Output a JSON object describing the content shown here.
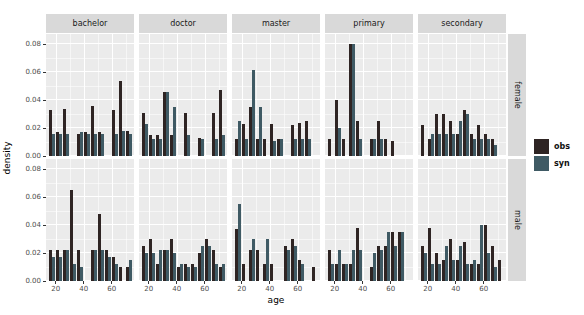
{
  "chart_data": {
    "type": "bar",
    "title": "",
    "xlabel": "age",
    "ylabel": "density",
    "x_ticks": [
      20,
      40,
      60
    ],
    "x_minor_ticks": [
      30,
      50,
      70
    ],
    "y_ticks": [
      0.0,
      0.02,
      0.04,
      0.06,
      0.08
    ],
    "xlim": [
      13,
      76
    ],
    "ylim": [
      0,
      0.0875
    ],
    "grid": true,
    "legend_position": "right",
    "col_facets": [
      "bachelor",
      "doctor",
      "master",
      "primary",
      "secondary"
    ],
    "row_facets": [
      "female",
      "male"
    ],
    "age_bin_left_edges": [
      15,
      20,
      25,
      30,
      35,
      40,
      45,
      50,
      55,
      60,
      65,
      70
    ],
    "age_bin_width": 5,
    "series_names": [
      "obs",
      "syn"
    ],
    "panels": [
      {
        "row": "female",
        "col": "bachelor",
        "obs": [
          0.033,
          0.017,
          0.034,
          0,
          0.016,
          0.017,
          0.036,
          0.017,
          0,
          0.033,
          0.054,
          0.018
        ],
        "syn": [
          0.016,
          0.016,
          0.016,
          0,
          0.017,
          0.016,
          0.016,
          0.016,
          0,
          0.016,
          0.018,
          0.016
        ]
      },
      {
        "row": "female",
        "col": "doctor",
        "obs": [
          0.031,
          0.015,
          0.015,
          0.046,
          0.015,
          0,
          0.031,
          0,
          0.013,
          0,
          0.031,
          0.047
        ],
        "syn": [
          0.023,
          0.012,
          0.012,
          0.046,
          0.035,
          0,
          0.015,
          0,
          0.012,
          0,
          0.012,
          0.015
        ]
      },
      {
        "row": "female",
        "col": "master",
        "obs": [
          0.012,
          0.023,
          0.035,
          0.012,
          0.012,
          0.023,
          0.012,
          0,
          0.022,
          0.024,
          0.025,
          0
        ],
        "syn": [
          0.025,
          0.012,
          0.062,
          0.035,
          0,
          0.011,
          0.012,
          0,
          0.012,
          0.012,
          0.012,
          0
        ]
      },
      {
        "row": "female",
        "col": "primary",
        "obs": [
          0.012,
          0.04,
          0.012,
          0.08,
          0.025,
          0,
          0.012,
          0.025,
          0.012,
          0.011,
          0,
          0
        ],
        "syn": [
          0,
          0.02,
          0,
          0.08,
          0.012,
          0,
          0.012,
          0.012,
          0,
          0,
          0,
          0
        ]
      },
      {
        "row": "female",
        "col": "secondary",
        "obs": [
          0.022,
          0.012,
          0.03,
          0.03,
          0.025,
          0.016,
          0.033,
          0.016,
          0.022,
          0.016,
          0.012,
          0
        ],
        "syn": [
          0,
          0.016,
          0.016,
          0.016,
          0.016,
          0.025,
          0.03,
          0.012,
          0.012,
          0.012,
          0.008,
          0
        ]
      },
      {
        "row": "male",
        "col": "bachelor",
        "obs": [
          0.022,
          0.022,
          0.022,
          0.065,
          0.022,
          0,
          0.022,
          0.048,
          0.022,
          0.017,
          0.01,
          0.01
        ],
        "syn": [
          0.017,
          0.017,
          0.022,
          0.012,
          0.01,
          0,
          0.022,
          0.022,
          0.017,
          0.012,
          0,
          0.015
        ]
      },
      {
        "row": "male",
        "col": "doctor",
        "obs": [
          0.025,
          0.03,
          0.012,
          0.022,
          0.03,
          0.01,
          0.012,
          0.012,
          0.02,
          0.03,
          0.022,
          0.01
        ],
        "syn": [
          0.02,
          0.02,
          0.022,
          0.022,
          0.02,
          0.012,
          0.01,
          0.01,
          0.025,
          0.025,
          0.012,
          0.012
        ]
      },
      {
        "row": "male",
        "col": "master",
        "obs": [
          0.037,
          0.012,
          0.022,
          0.022,
          0.012,
          0.012,
          0,
          0.025,
          0.03,
          0.015,
          0,
          0.01
        ],
        "syn": [
          0.055,
          0,
          0.03,
          0,
          0.03,
          0,
          0,
          0.022,
          0.025,
          0.012,
          0,
          0
        ]
      },
      {
        "row": "male",
        "col": "primary",
        "obs": [
          0.022,
          0.012,
          0.012,
          0.012,
          0.038,
          0,
          0.01,
          0.025,
          0.025,
          0.035,
          0.035,
          0
        ],
        "syn": [
          0.012,
          0.022,
          0.012,
          0.022,
          0.022,
          0,
          0.02,
          0.022,
          0.035,
          0.025,
          0.035,
          0
        ]
      },
      {
        "row": "male",
        "col": "secondary",
        "obs": [
          0.025,
          0.038,
          0.02,
          0.015,
          0.03,
          0.015,
          0.028,
          0.012,
          0.012,
          0.04,
          0.025,
          0.015
        ],
        "syn": [
          0.02,
          0.012,
          0.012,
          0.025,
          0.015,
          0.025,
          0.012,
          0.015,
          0.04,
          0.02,
          0.01,
          0
        ]
      }
    ]
  },
  "legend": {
    "items": [
      {
        "label": "obs",
        "color": "#2E2423"
      },
      {
        "label": "syn",
        "color": "#3F5A64"
      }
    ]
  },
  "style": {
    "panel_bg": "#EBEBEB",
    "strip_bg": "#D9D9D9",
    "grid_color": "#FFFFFF",
    "tick_text_color": "#4D4D4D"
  }
}
